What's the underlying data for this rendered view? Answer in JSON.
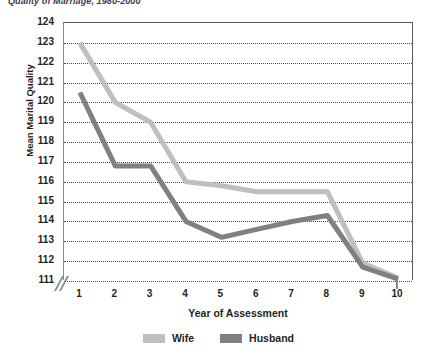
{
  "caption": "Quality of Marriage, 1980-2000",
  "chart_data": {
    "type": "line",
    "title": "",
    "xlabel": "Year of Assessment",
    "ylabel": "Mean Marital Quality",
    "x": [
      1,
      2,
      3,
      4,
      5,
      6,
      7,
      8,
      9,
      10
    ],
    "xticklabels": [
      "1",
      "2",
      "3",
      "4",
      "5",
      "6",
      "7",
      "8",
      "9",
      "10"
    ],
    "yticklabels": [
      "124",
      "123",
      "122",
      "121",
      "120",
      "119",
      "118",
      "117",
      "116",
      "115",
      "114",
      "113",
      "112",
      "111"
    ],
    "ylim": [
      111,
      124
    ],
    "xlim": [
      0.55,
      10.45
    ],
    "grid": true,
    "axis_break": true,
    "legend_position": "bottom-center",
    "series": [
      {
        "name": "Wife",
        "color": "#bfbfbf",
        "values": [
          123.0,
          120.0,
          119.0,
          116.0,
          115.8,
          115.5,
          115.5,
          115.5,
          111.9,
          111.15
        ]
      },
      {
        "name": "Husband",
        "color": "#808080",
        "values": [
          120.5,
          116.8,
          116.8,
          114.0,
          113.2,
          113.6,
          114.0,
          114.3,
          111.7,
          111.1
        ]
      }
    ]
  }
}
